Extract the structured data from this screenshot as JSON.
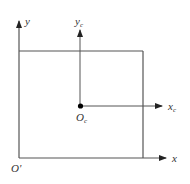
{
  "diagram": {
    "colors": {
      "line": "#555555",
      "text": "#333333",
      "dot": "#000000",
      "background": "#ffffff"
    },
    "frame": {
      "x1": 19,
      "y1": 51,
      "x2": 143,
      "y2": 158
    },
    "global_axes": {
      "origin_label": "O'",
      "x_label": "x",
      "y_label": "y",
      "origin": [
        19,
        158
      ],
      "x_arrow_tip": [
        167,
        158
      ],
      "y_arrow_tip": [
        19,
        20
      ]
    },
    "local_axes": {
      "origin_label_main": "O",
      "origin_label_sub": "c",
      "x_label_main": "x",
      "x_label_sub": "c",
      "y_label_main": "y",
      "y_label_sub": "c",
      "origin": [
        80,
        106
      ],
      "x_arrow_tip": [
        163,
        106
      ],
      "y_arrow_tip": [
        80,
        29
      ]
    }
  }
}
